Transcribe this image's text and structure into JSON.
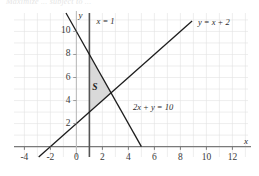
{
  "figure": {
    "title_fragment": "Maximize ... subject to ...",
    "region_label": "S"
  },
  "chart_data": {
    "type": "line",
    "title": "",
    "xlabel": "x",
    "ylabel": "y",
    "xlim": [
      -4.8,
      13.2
    ],
    "ylim": [
      -0.9,
      11.6
    ],
    "grid": true,
    "legend": "inline-annotations",
    "xticks": [
      -4,
      -2,
      0,
      2,
      4,
      6,
      8,
      10,
      12
    ],
    "xtick_labels": [
      "-4",
      "-2",
      "0",
      "2",
      "4",
      "6",
      "8",
      "10",
      "12"
    ],
    "yticks": [
      2,
      4,
      6,
      8,
      10
    ],
    "ytick_labels": [
      "2",
      "4",
      "6",
      "8",
      "10"
    ],
    "grid_step_x": 1,
    "grid_step_y": 1,
    "series": [
      {
        "name": "x = 1",
        "label": "x = 1",
        "kind": "vertical-line",
        "equation": "x = 1",
        "x": 1,
        "y_from": -0.9,
        "y_to": 11.6,
        "color": "#555555",
        "label_x": 1.55,
        "label_y": 10.9
      },
      {
        "name": "2x + y = 10",
        "label": "2x + y = 10",
        "kind": "line",
        "equation": "2x + y = 10",
        "slope": -2,
        "intercept": 10,
        "x_from": -0.8,
        "x_to": 5.0,
        "color": "#1d1d1d",
        "label_x": 4.35,
        "label_y": 3.45
      },
      {
        "name": "y = x + 2",
        "label": "y = x + 2",
        "kind": "line",
        "equation": "y = x + 2",
        "slope": 1,
        "intercept": 2,
        "x_from": -2.9,
        "x_to": 8.9,
        "color": "#1d1d1d",
        "label_x": 9.35,
        "label_y": 10.85
      }
    ],
    "shaded_region": {
      "name": "S",
      "label": "S",
      "fill": "#d9d9d9",
      "vertices": [
        [
          1,
          8
        ],
        [
          1,
          3
        ],
        [
          2.667,
          4.667
        ]
      ],
      "label_x": 1.42,
      "label_y": 5.1
    },
    "axis_color": "#7a7a7a",
    "grid_color": "#e2e2e2",
    "x_axis_label_pos": [
      13.05,
      0.45
    ],
    "y_axis_label_pos": [
      0.32,
      11.45
    ]
  }
}
